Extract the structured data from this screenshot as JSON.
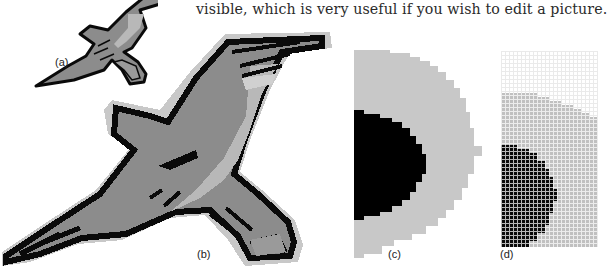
{
  "body_text": "visible, which is very useful if you wish to edit a picture.",
  "figure": {
    "panels": [
      {
        "id": "a",
        "label": "(a)",
        "description": "small bird illustration at normal size"
      },
      {
        "id": "b",
        "label": "(b)",
        "description": "bird enlarged showing pixelated edges"
      },
      {
        "id": "c",
        "label": "(c)",
        "description": "further enlarged eye region showing pixel blocks"
      },
      {
        "id": "d",
        "label": "(d)",
        "description": "maximum zoom with pixel grid visible"
      }
    ],
    "colors": {
      "outline": "#0a0a0a",
      "body_dark": "#8c8c8c",
      "body_light": "#b4b4b4",
      "halo": "#c8c8c8",
      "grid_line": "#ffffff"
    }
  }
}
